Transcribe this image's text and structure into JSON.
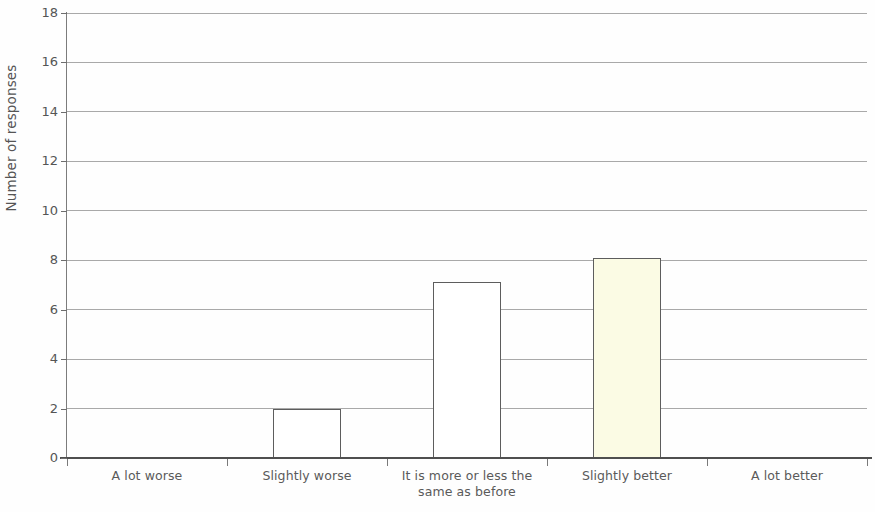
{
  "chart_data": {
    "type": "bar",
    "title": "",
    "subtitle": "",
    "xlabel": "",
    "ylabel": "Number of responses",
    "categories": [
      "A lot worse",
      "Slightly worse",
      "It is more or less the same as before",
      "Slightly better",
      "A lot better"
    ],
    "category_lines": [
      [
        "A lot worse"
      ],
      [
        "Slightly worse"
      ],
      [
        "It is more or less the",
        "same as before"
      ],
      [
        "Slightly better"
      ],
      [
        "A lot better"
      ]
    ],
    "values": [
      0,
      2,
      7.1,
      8.1,
      0
    ],
    "series": [
      {
        "name": "Number of responses",
        "values": [
          0,
          2,
          7.1,
          8.1,
          0
        ]
      }
    ],
    "ylim": [
      0,
      18
    ],
    "xlim": [
      0,
      5
    ],
    "y_ticks": [
      0,
      2,
      4,
      6,
      8,
      10,
      12,
      14,
      16,
      18
    ],
    "y_tick_labels": [
      "0",
      "2",
      "4",
      "6",
      "8",
      "10",
      "12",
      "14",
      "16",
      "18"
    ],
    "grid": true,
    "grid_axis": "y",
    "legend": false,
    "legend_position": "none",
    "bar_colors": [
      "#ffffff",
      "#ffffff",
      "#ffffff",
      "#fbfbe4",
      "#ffffff"
    ],
    "bar_edge_color": "#5d5d5d",
    "gridline_color": "#9a9a9a",
    "axis_color": "#4f4f4f",
    "text_color": "#555555",
    "background_color": "#fefefe",
    "annotations": []
  }
}
